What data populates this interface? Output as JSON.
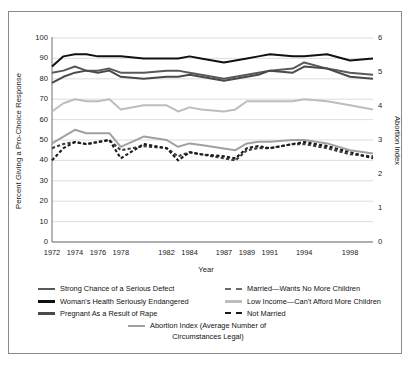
{
  "chart_data": {
    "type": "line",
    "title": "",
    "xlabel": "Year",
    "ylabel": "Percent Giving a Pro-Choice Response",
    "y2label": "Abortion Index",
    "ylim": [
      0,
      100
    ],
    "y2lim": [
      0,
      6
    ],
    "grid": true,
    "legend_position": "bottom",
    "yticks": [
      "100",
      "90",
      "80",
      "70",
      "60",
      "50",
      "40",
      "30",
      "20",
      "10",
      "0"
    ],
    "y2ticks": [
      "6",
      "5",
      "4",
      "3",
      "2",
      "1",
      "0"
    ],
    "xticklabels": [
      "1972",
      "1974",
      "1976",
      "1978",
      "1982",
      "1984",
      "1987",
      "1989",
      "1991",
      "1994",
      "1998"
    ],
    "x": [
      1972,
      1973,
      1974,
      1975,
      1976,
      1977,
      1978,
      1980,
      1982,
      1983,
      1984,
      1985,
      1987,
      1988,
      1989,
      1990,
      1991,
      1993,
      1994,
      1996,
      1998,
      2000
    ],
    "series": [
      {
        "name": "Strong Chance of a Serious Defect",
        "axis": "left",
        "color": "#595959",
        "style": "solid",
        "values": [
          83,
          84,
          86,
          84,
          84,
          85,
          83,
          83,
          84,
          84,
          83,
          82,
          80,
          81,
          82,
          83,
          84,
          85,
          88,
          85,
          83,
          82
        ]
      },
      {
        "name": "Woman's Health Seriously Endangered",
        "axis": "left",
        "color": "#111111",
        "style": "solid",
        "values": [
          86,
          91,
          92,
          92,
          91,
          91,
          91,
          90,
          90,
          90,
          91,
          90,
          88,
          89,
          90,
          91,
          92,
          91,
          91,
          92,
          89,
          90
        ]
      },
      {
        "name": "Pregnant As a Result of Rape",
        "axis": "left",
        "color": "#4a4a4a",
        "style": "solid",
        "values": [
          78,
          81,
          83,
          84,
          83,
          84,
          81,
          80,
          81,
          81,
          82,
          81,
          79,
          80,
          81,
          82,
          84,
          83,
          86,
          85,
          81,
          80
        ]
      },
      {
        "name": "Married—Wants No More Children",
        "axis": "left",
        "color": "#3f3f3f",
        "style": "dashed",
        "values": [
          46,
          48,
          49,
          48,
          49,
          50,
          45,
          47,
          46,
          42,
          44,
          43,
          41,
          40,
          45,
          46,
          46,
          48,
          48,
          46,
          43,
          42
        ]
      },
      {
        "name": "Low Income—Can't Afford More Children",
        "axis": "left",
        "color": "#bdbdbd",
        "style": "solid",
        "values": [
          64,
          68,
          70,
          69,
          69,
          70,
          65,
          67,
          67,
          64,
          66,
          65,
          64,
          65,
          69,
          69,
          69,
          69,
          70,
          69,
          67,
          65
        ]
      },
      {
        "name": "Not Married",
        "axis": "left",
        "color": "#1a1a1a",
        "style": "dashed",
        "values": [
          40,
          46,
          49,
          48,
          49,
          50,
          41,
          48,
          46,
          40,
          44,
          43,
          42,
          41,
          46,
          47,
          46,
          48,
          49,
          47,
          44,
          41
        ]
      },
      {
        "name": "Abortion Index (Average Number of Circumstances Legal)",
        "axis": "right",
        "color": "#a0a0a0",
        "style": "solid",
        "values": [
          2.9,
          3.1,
          3.3,
          3.2,
          3.2,
          3.2,
          2.8,
          3.1,
          3.0,
          2.8,
          2.9,
          2.85,
          2.75,
          2.7,
          2.9,
          2.95,
          2.95,
          3.0,
          3.0,
          2.9,
          2.7,
          2.6
        ]
      }
    ]
  },
  "axes": {
    "left_title": "Percent Giving a Pro-Choice Response",
    "right_title": "Abortion Index",
    "x_title": "Year"
  },
  "legend": {
    "col1": [
      {
        "label": "Strong Chance of a Serious Defect",
        "color": "#595959",
        "style": "solid"
      },
      {
        "label": "Woman's Health Seriously Endangered",
        "color": "#111111",
        "style": "solid"
      },
      {
        "label": "Pregnant As a Result of Rape",
        "color": "#4a4a4a",
        "style": "solid"
      }
    ],
    "col2": [
      {
        "label": "Married—Wants No More Children",
        "color": "#6b6b6b",
        "style": "dashed"
      },
      {
        "label": "Low Income—Can't Afford More Children",
        "color": "#bdbdbd",
        "style": "solid"
      },
      {
        "label": "Not Married",
        "color": "#1a1a1a",
        "style": "dashed"
      }
    ],
    "center": {
      "label_line1": "Abortion Index (Average Number of",
      "label_line2": "Circumstances Legal)",
      "color": "#a0a0a0",
      "style": "solid"
    }
  },
  "colors": {
    "frame": "#8a8a8a",
    "grid": "#d4d4d4",
    "axis": "#6f6f6f",
    "background": "#ffffff"
  }
}
